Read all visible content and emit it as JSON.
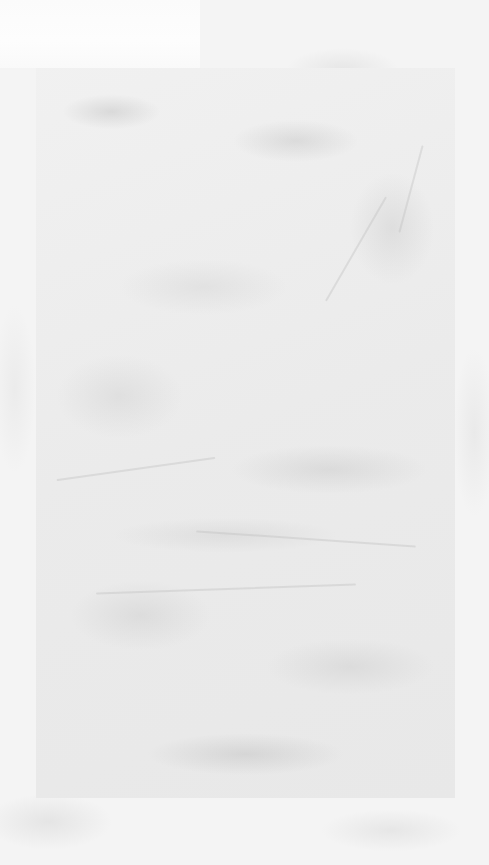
{
  "canvas": {
    "background_color": "#f4f4f4",
    "panel_color": "#ececec",
    "highlight_color": "#fbfbfb"
  }
}
